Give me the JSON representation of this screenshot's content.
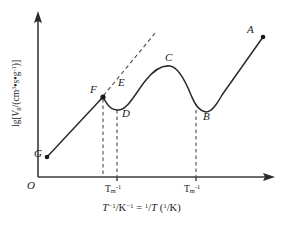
{
  "figure": {
    "name": "specific-retention-volume-vs-inverse-temperature-plot",
    "background_color": "#ffffff",
    "line_color": "#2b2b2b",
    "dash_color": "#4a4a4a"
  },
  "axes": {
    "origin_label": "O",
    "x_axis_title_html": "<span class=\"it\">T</span><sup>−1</sup>/K<sup>−1</sup> = <sup>1</sup>/<span class=\"it\">T</span> (<sup>1</sup>/K)",
    "x_axis_title_text": "T⁻¹/K⁻¹ = ¹/T (¹/K)",
    "y_axis_title_html": "lg[<span class=\"it\">V</span><sub>g</sub>/(cm<sup>3</sup>•s•g<sup>-1</sup>)]",
    "y_axis_title_text": "lg[Vg/(cm3•s•g-1)]",
    "x_ticks": [
      {
        "label_html": "T<sub>m</sub><sup>-1</sup>",
        "label_text": "Tm-1",
        "x": 117
      },
      {
        "label_html": "T<sub>m</sub><sup>-1</sup>",
        "label_text": "Tm-1",
        "x": 196
      }
    ]
  },
  "chart_data": {
    "type": "line",
    "title": "",
    "xlabel": "T⁻¹/K⁻¹ = ¹/T (¹/K)",
    "ylabel": "lg[Vg/(cm³•s•g⁻¹)]",
    "grid": false,
    "legend": "none",
    "axis_arrows": true,
    "series": [
      {
        "name": "retention-curve",
        "style": "solid",
        "points": [
          [
            47,
            157
          ],
          [
            60,
            142
          ],
          [
            75,
            124
          ],
          [
            90,
            107
          ],
          [
            103,
            97
          ],
          [
            108,
            104
          ],
          [
            113,
            109
          ],
          [
            119,
            110
          ],
          [
            126,
            106
          ],
          [
            134,
            96
          ],
          [
            143,
            84
          ],
          [
            152,
            74
          ],
          [
            161,
            67
          ],
          [
            170,
            66
          ],
          [
            179,
            74
          ],
          [
            188,
            90
          ],
          [
            194,
            102
          ],
          [
            199,
            109
          ],
          [
            206,
            112
          ],
          [
            213,
            108
          ],
          [
            222,
            95
          ],
          [
            233,
            78
          ],
          [
            245,
            60
          ],
          [
            256,
            44
          ],
          [
            263,
            37
          ]
        ]
      },
      {
        "name": "tangent-extrapolation",
        "style": "dashed",
        "points": [
          [
            100,
            100
          ],
          [
            155,
            33
          ]
        ]
      }
    ],
    "drop_lines": [
      {
        "name": "drop-line-F",
        "x": 103,
        "y_top": 97,
        "y_bottom": 177
      },
      {
        "name": "drop-line-D",
        "x": 117,
        "y_top": 110,
        "y_bottom": 177
      },
      {
        "name": "drop-line-B",
        "x": 196,
        "y_top": 112,
        "y_bottom": 177
      }
    ],
    "endpoint_markers": [
      {
        "name": "endpoint-G",
        "x": 47,
        "y": 157
      },
      {
        "name": "endpoint-F",
        "x": 103,
        "y": 97
      },
      {
        "name": "endpoint-A",
        "x": 263,
        "y": 37
      }
    ],
    "point_labels": [
      {
        "id": "A",
        "label": "A",
        "x": 247,
        "y": 24
      },
      {
        "id": "B",
        "label": "B",
        "x": 203,
        "y": 111
      },
      {
        "id": "C",
        "label": "C",
        "x": 165,
        "y": 52
      },
      {
        "id": "D",
        "label": "D",
        "x": 122,
        "y": 108
      },
      {
        "id": "E",
        "label": "E",
        "x": 118,
        "y": 77
      },
      {
        "id": "F",
        "label": "F",
        "x": 90,
        "y": 84
      },
      {
        "id": "G",
        "label": "G",
        "x": 34,
        "y": 148
      }
    ]
  }
}
